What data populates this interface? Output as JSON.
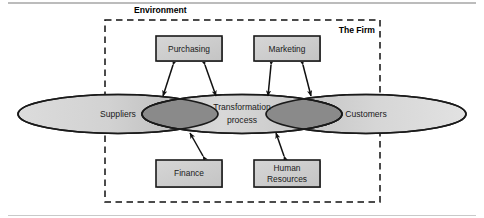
{
  "figure": {
    "labels": {
      "environment": "Environment",
      "the_firm": "The Firm"
    },
    "ellipses": [
      {
        "id": "suppliers",
        "label": "Suppliers",
        "cx": 118,
        "cy": 114,
        "rx": 100,
        "ry": 19.5
      },
      {
        "id": "transformation",
        "label_line1": "Transformation",
        "label_line2": "process",
        "cx": 242,
        "cy": 114,
        "rx": 100,
        "ry": 19.5
      },
      {
        "id": "customers",
        "label": "Customers",
        "cx": 366,
        "cy": 114,
        "rx": 100,
        "ry": 19.5
      }
    ],
    "boxes": [
      {
        "id": "purchasing",
        "label_line1": "Purchasing",
        "label_line2": "",
        "x": 156,
        "y": 36,
        "w": 66,
        "h": 25
      },
      {
        "id": "marketing",
        "label_line1": "Marketing",
        "label_line2": "",
        "x": 254,
        "y": 36,
        "w": 66,
        "h": 25
      },
      {
        "id": "finance",
        "label_line1": "Finance",
        "label_line2": "",
        "x": 156,
        "y": 160,
        "w": 66,
        "h": 27
      },
      {
        "id": "human-resources",
        "label_line1": "Human",
        "label_line2": "Resources",
        "x": 254,
        "y": 160,
        "w": 66,
        "h": 27
      }
    ],
    "dashed_frame": {
      "x": 105,
      "y": 20,
      "w": 275,
      "h": 182
    },
    "colors": {
      "ellipse_fill_light": "#d2d2d2",
      "ellipse_fill_dark": "#b8b8b8",
      "overlap_fill": "#8a8a8a",
      "box_fill": "#cccccc",
      "outline": "#1a1a1a",
      "rule": "#a6a6a6",
      "text": "#1a1a1a"
    },
    "rules": [
      {
        "id": "top-rule",
        "y": 3
      },
      {
        "id": "bottom-rule",
        "y": 215
      }
    ]
  }
}
